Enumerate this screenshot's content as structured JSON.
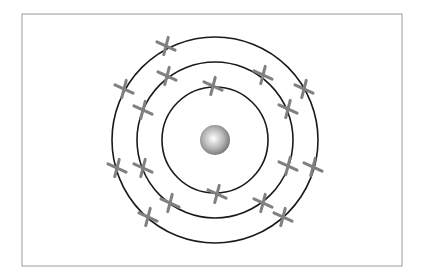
{
  "diagram": {
    "type": "atom-electron-shell",
    "frame": {
      "x": 22,
      "y": 14,
      "width": 380,
      "height": 252,
      "stroke": "#9a9a9a"
    },
    "center": {
      "x": 215,
      "y": 140
    },
    "nucleus": {
      "radius": 15,
      "highlight": "#ffffff",
      "shade": "#6e6e6e"
    },
    "shells": [
      {
        "name": "shell-1",
        "radius": 53,
        "electron_count": 2
      },
      {
        "name": "shell-2",
        "radius": 78,
        "electron_count": 8
      },
      {
        "name": "shell-3",
        "radius": 103,
        "electron_count": 7
      }
    ],
    "electron_color": "#808080",
    "shell_color": "#1a1a1a",
    "electrons": [
      {
        "shell": 1,
        "x": 213,
        "y": 86
      },
      {
        "shell": 1,
        "x": 217,
        "y": 194
      },
      {
        "shell": 2,
        "x": 167,
        "y": 76
      },
      {
        "shell": 2,
        "x": 143,
        "y": 110
      },
      {
        "shell": 2,
        "x": 143,
        "y": 168
      },
      {
        "shell": 2,
        "x": 170,
        "y": 203
      },
      {
        "shell": 2,
        "x": 263,
        "y": 75
      },
      {
        "shell": 2,
        "x": 288,
        "y": 109
      },
      {
        "shell": 2,
        "x": 288,
        "y": 166
      },
      {
        "shell": 2,
        "x": 263,
        "y": 203
      },
      {
        "shell": 3,
        "x": 166,
        "y": 46
      },
      {
        "shell": 3,
        "x": 124,
        "y": 89
      },
      {
        "shell": 3,
        "x": 117,
        "y": 168
      },
      {
        "shell": 3,
        "x": 148,
        "y": 217
      },
      {
        "shell": 3,
        "x": 304,
        "y": 89
      },
      {
        "shell": 3,
        "x": 313,
        "y": 167
      },
      {
        "shell": 3,
        "x": 283,
        "y": 217
      }
    ]
  }
}
